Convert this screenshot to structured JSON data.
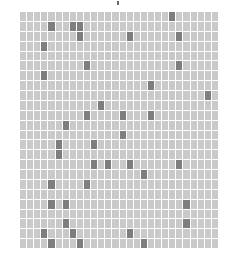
{
  "grid": {
    "rows": 24,
    "cols": 28,
    "colors": {
      "light": "#c9c9c9",
      "dark": "#7e7e7e",
      "gap": "#ffffff"
    },
    "dark_cells": [
      [
        0,
        21
      ],
      [
        1,
        4
      ],
      [
        1,
        7
      ],
      [
        1,
        8
      ],
      [
        2,
        8
      ],
      [
        2,
        15
      ],
      [
        2,
        22
      ],
      [
        3,
        3
      ],
      [
        5,
        9
      ],
      [
        5,
        22
      ],
      [
        6,
        3
      ],
      [
        7,
        18
      ],
      [
        8,
        26
      ],
      [
        9,
        11
      ],
      [
        10,
        9
      ],
      [
        10,
        14
      ],
      [
        10,
        18
      ],
      [
        11,
        6
      ],
      [
        12,
        14
      ],
      [
        13,
        5
      ],
      [
        13,
        10
      ],
      [
        14,
        5
      ],
      [
        15,
        10
      ],
      [
        15,
        12
      ],
      [
        15,
        15
      ],
      [
        15,
        22
      ],
      [
        16,
        17
      ],
      [
        17,
        4
      ],
      [
        17,
        9
      ],
      [
        19,
        4
      ],
      [
        19,
        6
      ],
      [
        19,
        23
      ],
      [
        21,
        6
      ],
      [
        21,
        23
      ],
      [
        22,
        3
      ],
      [
        22,
        7
      ],
      [
        22,
        15
      ],
      [
        23,
        4
      ],
      [
        23,
        8
      ],
      [
        23,
        17
      ]
    ]
  },
  "top_mark": {
    "icon": "cursor-mark-icon"
  }
}
